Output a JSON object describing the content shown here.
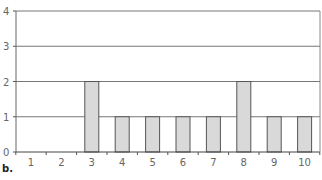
{
  "chart_data": {
    "type": "bar",
    "title": "",
    "xlabel": "",
    "ylabel": "",
    "categories": [
      "1",
      "2",
      "3",
      "4",
      "5",
      "6",
      "7",
      "8",
      "9",
      "10"
    ],
    "values": [
      0,
      0,
      2,
      1,
      1,
      1,
      1,
      2,
      1,
      1
    ],
    "ylim": [
      0,
      4
    ],
    "yticks": [
      0,
      1,
      2,
      3,
      4
    ],
    "grid": true,
    "legend": null,
    "bar_color": "#d9d9d9",
    "bar_edge_color": "#555555",
    "grid_color": "#777777"
  },
  "caption": "b."
}
